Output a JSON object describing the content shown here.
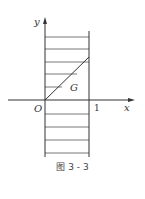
{
  "figure": {
    "caption": "图 3 - 3",
    "axis_labels": {
      "x": "x",
      "y": "y",
      "origin": "O"
    },
    "tick_labels": {
      "x_one": "1"
    },
    "region_label": "G"
  }
}
